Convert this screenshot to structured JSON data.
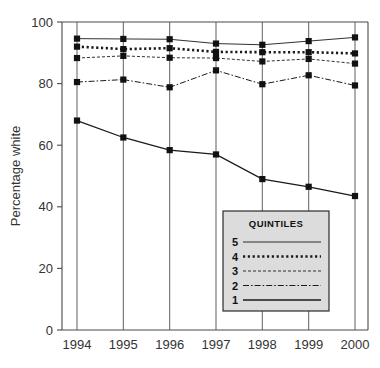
{
  "chart_data": {
    "type": "line",
    "title": "",
    "xlabel": "",
    "ylabel": "Percentage white",
    "x": [
      1994,
      1995,
      1996,
      1997,
      1998,
      1999,
      2000
    ],
    "xtick_labels": [
      "1994",
      "1995",
      "1996",
      "1997",
      "1998",
      "1999",
      "2000"
    ],
    "ytick_labels": [
      "0",
      "20",
      "40",
      "60",
      "80",
      "100"
    ],
    "yticks": [
      0,
      20,
      40,
      60,
      80,
      100
    ],
    "ylim": [
      0,
      100
    ],
    "grid": "vertical",
    "legend_position": "inside-bottom-right",
    "legend_title": "QUINTILES",
    "series": [
      {
        "name": "5",
        "label": "5",
        "style": "thin-solid",
        "values": [
          94.6,
          94.5,
          94.4,
          93.0,
          92.6,
          93.8,
          95.0
        ]
      },
      {
        "name": "4",
        "label": "4",
        "style": "thick-dotted",
        "values": [
          92.0,
          91.2,
          91.5,
          90.3,
          90.2,
          90.2,
          89.8
        ]
      },
      {
        "name": "3",
        "label": "3",
        "style": "fine-dashed",
        "values": [
          88.3,
          89.0,
          88.4,
          88.3,
          87.2,
          88.0,
          86.5
        ]
      },
      {
        "name": "2",
        "label": "2",
        "style": "dash-dot",
        "values": [
          80.5,
          81.3,
          78.8,
          84.3,
          79.8,
          82.7,
          79.4
        ]
      },
      {
        "name": "1",
        "label": "1",
        "style": "medium-solid",
        "values": [
          68.0,
          62.5,
          58.4,
          57.0,
          49.0,
          46.5,
          43.5
        ]
      }
    ],
    "colors": {
      "series_line": "#1a1a1a",
      "marker": "#111111",
      "grid": "#6e6e6e",
      "axis": "#4a4a4a",
      "legend_fill": "#dcdcdc",
      "legend_border": "#2b2b2b",
      "text": "#333333"
    }
  }
}
